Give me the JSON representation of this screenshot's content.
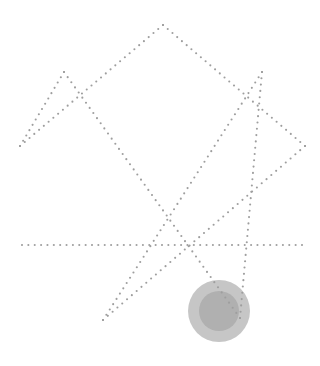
{
  "canvas": {
    "width": 320,
    "height": 366,
    "background_color": "#ffffff",
    "title": "Dotted seven-pointed star with shaded disc"
  },
  "figure": {
    "name": "heptagram-figure",
    "stroke_color": "#9e9e9e",
    "dot_radius": 1.05,
    "dot_spacing": 6.3,
    "line_style": "dotted"
  },
  "star": {
    "name": "dotted-heptagram",
    "type": "star-polygon",
    "points": 7,
    "step": 2,
    "schlafli": "{7/2}",
    "center": {
      "x": 163,
      "y": 152
    },
    "circumradius": 132,
    "rotation_degrees": -90,
    "vertices": [
      {
        "label": "top",
        "x": 163,
        "y": 25
      },
      {
        "label": "upper-right",
        "x": 262,
        "y": 72
      },
      {
        "label": "right",
        "x": 305,
        "y": 146
      },
      {
        "label": "lower-right",
        "x": 240,
        "y": 318
      },
      {
        "label": "lower-left",
        "x": 103,
        "y": 320
      },
      {
        "label": "left",
        "x": 20,
        "y": 146
      },
      {
        "label": "upper-left",
        "x": 64,
        "y": 72
      }
    ],
    "edges": [
      {
        "from": "top",
        "to": "right"
      },
      {
        "from": "right",
        "to": "lower-left"
      },
      {
        "from": "lower-left",
        "to": "upper-right"
      },
      {
        "from": "upper-right",
        "to": "lower-right"
      },
      {
        "from": "lower-right",
        "to": "upper-left"
      },
      {
        "from": "upper-left",
        "to": "left"
      },
      {
        "from": "left",
        "to": "top"
      }
    ],
    "baseline": {
      "label": "horizontal-chord",
      "y": 245,
      "x_start": 22,
      "x_end": 302
    }
  },
  "disc": {
    "name": "shaded-disc",
    "center": {
      "x": 219,
      "y": 311
    },
    "outer_radius": 31,
    "inner_radius": 20,
    "outer_color": "#c6c6c6",
    "inner_color": "#b0b0b0",
    "overlaps": "lower-right point of star"
  },
  "palette": {
    "background": "#ffffff",
    "dot_gray": "#9e9e9e",
    "disc_outer_gray": "#c6c6c6",
    "disc_inner_gray": "#b0b0b0"
  }
}
